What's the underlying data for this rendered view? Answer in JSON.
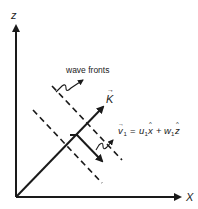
{
  "diagram": {
    "axes": {
      "x_label": "X",
      "z_label": "z"
    },
    "wave_vector": {
      "label": "K",
      "arrow_mark": "→"
    },
    "wave_fronts": {
      "label": "wave fronts"
    },
    "velocity": {
      "v": "v",
      "v_sub": "1",
      "eq_sign": "=",
      "u": "u",
      "u_sub": "1",
      "x_hat": "x",
      "plus": "+",
      "w": "w",
      "w_sub": "1",
      "z_hat": "z",
      "hat": "^",
      "arrow_mark": "→"
    },
    "colors": {
      "ink": "#1a1a1a",
      "background": "#ffffff"
    }
  }
}
